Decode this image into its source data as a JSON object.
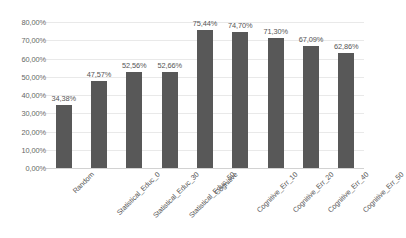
{
  "chart_data": {
    "type": "bar",
    "title": "",
    "subtitle": "",
    "xlabel": "",
    "ylabel": "",
    "grid": true,
    "legend": false,
    "legend_position": "none",
    "bar_color": "#585858",
    "gridline_color": "#e9e9e9",
    "axis_color": "#d2d2d2",
    "label_color": "#555555",
    "ylim": [
      0,
      80
    ],
    "ytick_values": [
      0,
      10,
      20,
      30,
      40,
      50,
      60,
      70,
      80
    ],
    "ytick_labels": [
      "0,00%",
      "10,00%",
      "20,00%",
      "30,00%",
      "40,00%",
      "50,00%",
      "60,00%",
      "70,00%",
      "80,00%"
    ],
    "categories": [
      "Random",
      "Statistical_Educ_0",
      "Statistical_Educ_30",
      "Statistical_Educ_50",
      "Cognitive",
      "Cognitive_Err_10",
      "Cognitive_Err_20",
      "Cognitive_Err_40",
      "Cognitive_Err_50"
    ],
    "values": [
      34.38,
      47.57,
      52.56,
      52.66,
      75.44,
      74.7,
      71.3,
      67.09,
      62.86
    ],
    "data_labels": [
      "34,38%",
      "47,57%",
      "52,56%",
      "52,66%",
      "75,44%",
      "74,70%",
      "71,30%",
      "67,09%",
      "62,86%"
    ]
  }
}
